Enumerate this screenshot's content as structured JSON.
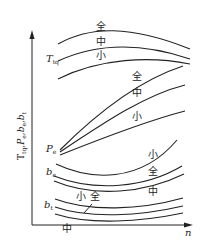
{
  "chart_data": {
    "type": "line",
    "title": "",
    "xlabel": "n",
    "ylabel": "T_tq, P_e, b_e, b_t",
    "grid": false,
    "legend": "inline labels",
    "series_groups": [
      {
        "name": "T_tq",
        "label": "T",
        "label_sub": "tq",
        "label_pos": [
          46,
          62
        ],
        "curves": [
          {
            "name": "全",
            "label_pos": [
              96,
              30
            ],
            "path": "M58,44 C90,26 130,25 190,49"
          },
          {
            "name": "中",
            "label_pos": [
              96,
              45
            ],
            "path": "M58,61 C95,44 140,42 190,59"
          },
          {
            "name": "小",
            "label_pos": [
              96,
              59
            ],
            "path": "M58,79 C100,58 150,56 190,64"
          }
        ]
      },
      {
        "name": "P_e",
        "label": "P",
        "label_sub": "e",
        "label_pos": [
          46,
          152
        ],
        "curves": [
          {
            "name": "全",
            "label_pos": [
              132,
              80
            ],
            "path": "M60,150 C100,110 140,80 183,66"
          },
          {
            "name": "中",
            "label_pos": [
              132,
              96
            ],
            "path": "M60,152 C105,122 145,95 185,85"
          },
          {
            "name": "小",
            "label_pos": [
              132,
              120
            ],
            "path": "M60,155 C105,137 150,120 185,111"
          }
        ]
      },
      {
        "name": "b_e",
        "label": "b",
        "label_sub": "e",
        "label_pos": [
          46,
          175
        ],
        "curves": [
          {
            "name": "小",
            "label_pos": [
              148,
              158
            ],
            "path": "M56,164 C90,180 140,184 177,140"
          },
          {
            "name": "全",
            "label_pos": [
              148,
              175
            ],
            "path": "M54,176 C95,192 145,188 182,166"
          },
          {
            "name": "中",
            "label_pos": [
              148,
              195
            ],
            "path": "M54,181 C95,198 145,193 184,174"
          }
        ]
      },
      {
        "name": "b_t",
        "label": "b",
        "label_sub": "t",
        "label_pos": [
          44,
          208
        ],
        "curves": [
          {
            "name": "小",
            "label_pos": [
              76,
              200
            ],
            "path": "M55,199 C90,212 140,210 183,198"
          },
          {
            "name": "全",
            "label_pos": [
              90,
              200
            ],
            "path": "M55,207 C90,219 140,216 183,206"
          },
          {
            "name": "中",
            "label_pos": [
              62,
              232
            ],
            "path": "M55,214 C90,225 140,222 183,213"
          }
        ]
      }
    ],
    "axes": {
      "origin": [
        32,
        225
      ],
      "y_top": 33,
      "x_right": 192
    }
  }
}
